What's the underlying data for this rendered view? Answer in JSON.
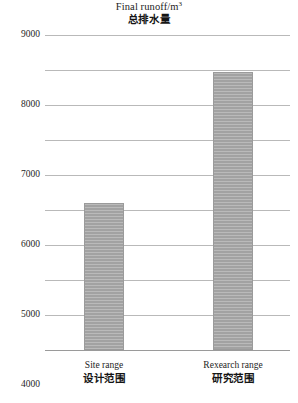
{
  "chart_data": {
    "type": "bar",
    "title": "Final runoff/m3",
    "title_en_prefix": "Final runoff/m",
    "title_en_superscript": "3",
    "title_cn": "总排水量",
    "xlabel": "",
    "ylabel": "",
    "ylim": [
      0,
      9000
    ],
    "ytick_step": 1000,
    "grid": true,
    "legend": "none",
    "yticks": [
      "9000",
      "8000",
      "7000",
      "6000",
      "5000",
      "4000",
      "3000",
      "2000",
      "1000",
      "0"
    ],
    "ytick_values": [
      9000,
      8000,
      7000,
      6000,
      5000,
      4000,
      3000,
      2000,
      1000,
      0
    ],
    "categories": [
      "Site range",
      "Rexearch range"
    ],
    "categories_cn": [
      "设计范围",
      "研究范围"
    ],
    "values": [
      4200,
      7950
    ],
    "series": [
      {
        "name": "Final runoff",
        "values": [
          4200,
          7950
        ]
      }
    ],
    "bar_color": "#a9a9a9",
    "gridline_color": "#b9b9b9",
    "axis_color": "#9a9a9a"
  }
}
